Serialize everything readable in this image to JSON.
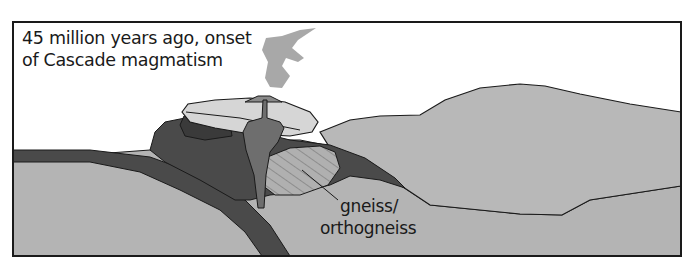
{
  "title": {
    "line1": "45 million years ago, onset",
    "line2": "of Cascade magmatism"
  },
  "labels": {
    "gneiss_line1": "gneiss/",
    "gneiss_line2": "orthogneiss"
  },
  "colors": {
    "frame": "#1a1a1a",
    "crust_light": "#b4b4b4",
    "crust_upper": "#b8b8b8",
    "dark_unit": "#4a4a4a",
    "mid_dark": "#6e6e6e",
    "volcanic_cap": "#d6d6d6",
    "plume": "#a8a8a8",
    "gneiss_fill": "#b0b0b0",
    "volcano_cone": "#8a8a8a"
  }
}
